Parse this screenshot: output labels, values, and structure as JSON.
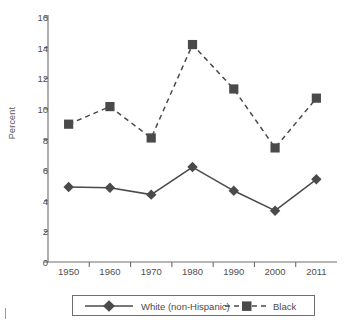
{
  "chart_data": {
    "type": "line",
    "title": "",
    "xlabel": "",
    "ylabel": "Percent",
    "categories": [
      "1950",
      "1960",
      "1970",
      "1980",
      "1990",
      "2000",
      "2011"
    ],
    "ylim": [
      0,
      16
    ],
    "yticks": [
      0,
      2,
      4,
      6,
      8,
      10,
      12,
      14,
      16
    ],
    "ytick_labels": [
      "0",
      "2",
      "4",
      "6",
      "8",
      "10",
      "12",
      "14",
      "16"
    ],
    "grid": false,
    "legend_position": "bottom",
    "series": [
      {
        "name": "White (non-Hispanic)",
        "values": [
          4.9,
          4.85,
          4.4,
          6.2,
          4.65,
          3.35,
          5.4
        ],
        "marker": "diamond",
        "line_style": "solid",
        "color": "#4a4a4a"
      },
      {
        "name": "Black",
        "values": [
          9.0,
          10.15,
          8.1,
          14.2,
          11.3,
          7.45,
          10.7
        ],
        "marker": "square",
        "line_style": "dashed",
        "color": "#4a4a4a"
      }
    ]
  },
  "axes": {
    "y_axis_label": "Percent"
  },
  "legend": {
    "entries": [
      {
        "label": "White (non-Hispanic)"
      },
      {
        "label": "Black"
      }
    ]
  },
  "colors": {
    "series": "#4a4a4a",
    "axis": "#6e6e6e",
    "text": "#4f4f4f",
    "background": "#ffffff"
  }
}
